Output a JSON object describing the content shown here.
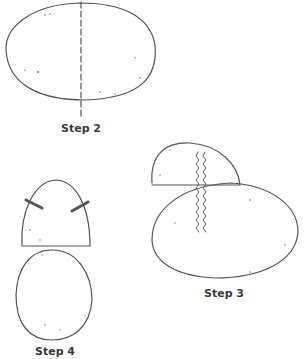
{
  "diagram": {
    "ink_color": "#555555",
    "steps": [
      {
        "id": "step2",
        "label": "Step 2",
        "description": "Oval shape with vertical dashed cut line"
      },
      {
        "id": "step3",
        "label": "Step 3",
        "description": "Half-dome piece overlapping oval with stitched seam"
      },
      {
        "id": "step4",
        "label": "Step 4",
        "description": "Half-dome with two stitched tabs above an oval"
      }
    ]
  }
}
